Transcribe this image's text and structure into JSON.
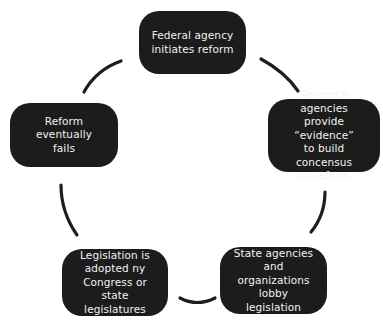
{
  "diagram": {
    "type": "cycle",
    "node_color": "#1c1c1c",
    "text_color": "#f2f2f2",
    "connector_color": "#1e1e1e",
    "nodes": [
      {
        "id": "n1",
        "label": "Federal agency\ninitiates reform"
      },
      {
        "id": "n2",
        "label": "Research agencies\nprovide “evidence”\nto build concensus\non reform"
      },
      {
        "id": "n3",
        "label": "State agencies and\norganizations lobby\nlegislation"
      },
      {
        "id": "n4",
        "label": "Legislation is\nadopted ny\nCongress or state\nlegislatures"
      },
      {
        "id": "n5",
        "label": "Reform eventually\nfails"
      }
    ],
    "edges": [
      {
        "from": "n1",
        "to": "n2"
      },
      {
        "from": "n2",
        "to": "n3"
      },
      {
        "from": "n3",
        "to": "n4"
      },
      {
        "from": "n4",
        "to": "n5"
      },
      {
        "from": "n5",
        "to": "n1"
      }
    ]
  }
}
